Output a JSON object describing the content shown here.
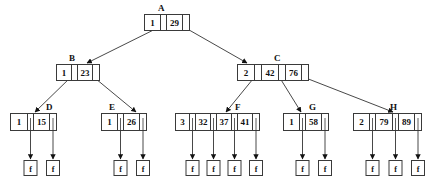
{
  "diagram": {
    "type": "b-tree",
    "nodes": [
      {
        "id": "A",
        "label": "A",
        "entries": [
          {
            "first": "1",
            "key": "29"
          }
        ],
        "children": [
          "B",
          "C"
        ]
      },
      {
        "id": "B",
        "label": "B",
        "entries": [
          {
            "first": "1",
            "key": "23"
          }
        ],
        "children": [
          "D",
          "E"
        ]
      },
      {
        "id": "C",
        "label": "C",
        "first": "2",
        "entries": [
          {
            "key": "42"
          },
          {
            "key": "76"
          }
        ],
        "children": [
          "F",
          "G",
          "H"
        ]
      },
      {
        "id": "D",
        "label": "D",
        "first": "1",
        "keys": [
          "15"
        ],
        "leaves": 2
      },
      {
        "id": "E",
        "label": "E",
        "first": "1",
        "keys": [
          "26"
        ],
        "leaves": 2
      },
      {
        "id": "F",
        "label": "F",
        "first": "3",
        "keys": [
          "32",
          "37",
          "41"
        ],
        "leaves": 4
      },
      {
        "id": "G",
        "label": "G",
        "first": "1",
        "keys": [
          "58"
        ],
        "leaves": 2
      },
      {
        "id": "H",
        "label": "H",
        "first": "2",
        "keys": [
          "79",
          "89"
        ],
        "leaves": 3
      }
    ],
    "leaf_text": "f",
    "colors": {
      "stroke": "#333333",
      "fill": "#ffffff",
      "text": "#111111"
    }
  }
}
